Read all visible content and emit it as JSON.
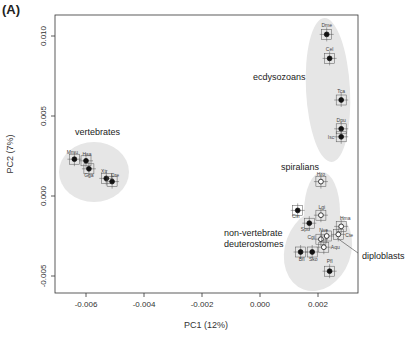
{
  "panel_label": "(A)",
  "chart_data": {
    "type": "scatter",
    "title": "",
    "xlabel": "PC1 (12%)",
    "ylabel": "PC2 (7%)",
    "xlim": [
      -0.0071,
      0.0034
    ],
    "ylim": [
      -0.0061,
      0.0112
    ],
    "xticks": [
      -0.006,
      -0.004,
      -0.002,
      0.0,
      0.002
    ],
    "xtick_labels": [
      "-0.006",
      "-0.004",
      "-0.002",
      "0.000",
      "0.002"
    ],
    "yticks": [
      -0.005,
      0.0,
      0.005,
      0.01
    ],
    "ytick_labels": [
      "-0.005",
      "0.000",
      "0.005",
      "0.010"
    ],
    "grid": false,
    "legend": null,
    "groups": [
      {
        "name": "vertebrates",
        "marker": "filled"
      },
      {
        "name": "ecdysozoans",
        "marker": "filled"
      },
      {
        "name": "spiralians",
        "marker": "open"
      },
      {
        "name": "non-vertebrate deuterostomes",
        "marker": "filled"
      },
      {
        "name": "diploblasts",
        "marker": "open"
      }
    ],
    "points": [
      {
        "label": "Dme",
        "group": "ecdysozoans",
        "x": 0.0023,
        "y": 0.0101
      },
      {
        "label": "Cel",
        "group": "ecdysozoans",
        "x": 0.0024,
        "y": 0.0086
      },
      {
        "label": "Tca",
        "group": "ecdysozoans",
        "x": 0.0028,
        "y": 0.006
      },
      {
        "label": "Dpu",
        "group": "ecdysozoans",
        "x": 0.0028,
        "y": 0.0042
      },
      {
        "label": "Isc",
        "group": "ecdysozoans",
        "x": 0.0028,
        "y": 0.0037
      },
      {
        "label": "Mmu",
        "group": "vertebrates",
        "x": -0.0064,
        "y": 0.0023
      },
      {
        "label": "Hsa",
        "group": "vertebrates",
        "x": -0.006,
        "y": 0.0022
      },
      {
        "label": "Gga",
        "group": "vertebrates",
        "x": -0.0059,
        "y": 0.0017
      },
      {
        "label": "Xtr",
        "group": "vertebrates",
        "x": -0.0053,
        "y": 0.0011
      },
      {
        "label": "Dre",
        "group": "vertebrates",
        "x": -0.0051,
        "y": 0.0009
      },
      {
        "label": "Hro",
        "group": "spiralians",
        "x": 0.0021,
        "y": 0.0009
      },
      {
        "label": "Lgi",
        "group": "spiralians",
        "x": 0.0021,
        "y": -0.0012
      },
      {
        "label": "Cgi",
        "group": "spiralians",
        "x": 0.0021,
        "y": -0.0027
      },
      {
        "label": "Cin",
        "group": "non-vertebrate deuterostomes",
        "x": 0.0013,
        "y": -0.0009
      },
      {
        "label": "Spu",
        "group": "non-vertebrate deuterostomes",
        "x": 0.0017,
        "y": -0.0017
      },
      {
        "label": "Bfl",
        "group": "non-vertebrate deuterostomes",
        "x": 0.0014,
        "y": -0.0035
      },
      {
        "label": "Sko",
        "group": "non-vertebrate deuterostomes",
        "x": 0.0018,
        "y": -0.0035
      },
      {
        "label": "Pfl",
        "group": "non-vertebrate deuterostomes",
        "x": 0.0024,
        "y": -0.0047
      },
      {
        "label": "Hma",
        "group": "diploblasts",
        "x": 0.0028,
        "y": -0.0019
      },
      {
        "label": "Nve",
        "group": "diploblasts",
        "x": 0.0023,
        "y": -0.0025
      },
      {
        "label": "Cte",
        "group": "diploblasts",
        "x": 0.0027,
        "y": -0.0024
      },
      {
        "label": "Aqu",
        "group": "diploblasts",
        "x": 0.0022,
        "y": -0.0032
      }
    ],
    "annotations": [
      "vertebrates",
      "ecdysozoans",
      "spiralians",
      "non-vertebrate deuterostomes",
      "diploblasts"
    ]
  },
  "labels": {
    "vertebrates": "vertebrates",
    "ecdysozoans": "ecdysozoans",
    "spiralians": "spiralians",
    "nvd1": "non-vertebrate",
    "nvd2": "deuterostomes",
    "diploblasts": "diploblasts"
  }
}
